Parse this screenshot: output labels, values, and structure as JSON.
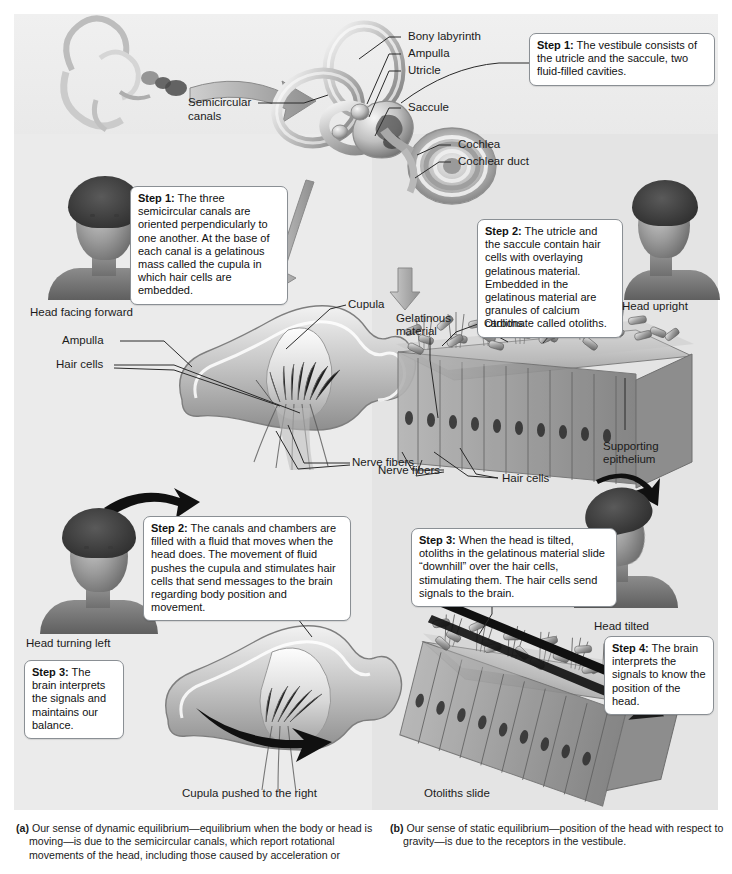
{
  "figure": {
    "panel_a": {
      "letter": "(a)",
      "caption": "Our sense of dynamic equilibrium—equilibrium when the body or head is moving—is due to the semicircular canals, which report rotational movements of the head, including those caused by acceleration or",
      "labels": {
        "semicircular_canals": "Semicircular\ncanals",
        "head_facing_forward": "Head facing forward",
        "head_turning_left": "Head turning left",
        "ampulla": "Ampulla",
        "hair_cells": "Hair cells",
        "cupula": "Cupula",
        "nerve_fibers": "Nerve fibers",
        "cupula_pushed": "Cupula pushed to the right"
      },
      "callouts": {
        "step1": {
          "label": "Step 1:",
          "text": " The three semicircular canals are oriented perpendicularly to one another. At the base of each canal is a gelatinous mass called the cupula in which hair cells are embedded."
        },
        "step2": {
          "label": "Step 2:",
          "text": " The canals and chambers are filled with a fluid that moves when the head does. The movement of fluid pushes the cupula and stimulates hair cells that send messages to the brain regarding body position and movement."
        },
        "step3": {
          "label": "Step 3:",
          "text": " The brain interprets the signals and maintains our balance."
        }
      }
    },
    "panel_b": {
      "letter": "(b)",
      "caption": "Our sense of static equilibrium—position of the head with respect to gravity—is due to the receptors in the vestibule.",
      "labels": {
        "bony_labyrinth": "Bony labyrinth",
        "ampulla": "Ampulla",
        "utricle": "Utricle",
        "saccule": "Saccule",
        "cochlea": "Cochlea",
        "cochlear_duct": "Cochlear duct",
        "head_upright": "Head upright",
        "head_tilted": "Head tilted",
        "gelatinous_material": "Gelatinous\nmaterial",
        "otoliths": "Otoliths",
        "supporting_epithelium": "Supporting\nepithelium",
        "nerve_fibers": "Nerve fibers",
        "hair_cells": "Hair cells",
        "otoliths_slide": "Otoliths slide"
      },
      "callouts": {
        "step1": {
          "label": "Step 1:",
          "text": " The vestibule consists of the utricle and the saccule, two fluid-filled cavities."
        },
        "step2": {
          "label": "Step 2:",
          "text": " The utricle and the saccule contain hair cells with overlaying gelatinous material. Embedded in the gelatinous material are granules of calcium carbonate called otoliths."
        },
        "step3": {
          "label": "Step 3:",
          "text": " When the head is tilted, otoliths in the gelatinous material slide “downhill” over the hair cells, stimulating them. The hair cells send signals to the brain."
        },
        "step4": {
          "label": "Step 4:",
          "text": " The brain interprets the signals to know the position of the head."
        }
      }
    }
  },
  "colors": {
    "panel_left_bg": "#ebebeb",
    "panel_right_bg": "#e4e4e4",
    "callout_border": "#8a8f94",
    "text": "#1b1b1b",
    "leader": "#2a2a2a"
  }
}
